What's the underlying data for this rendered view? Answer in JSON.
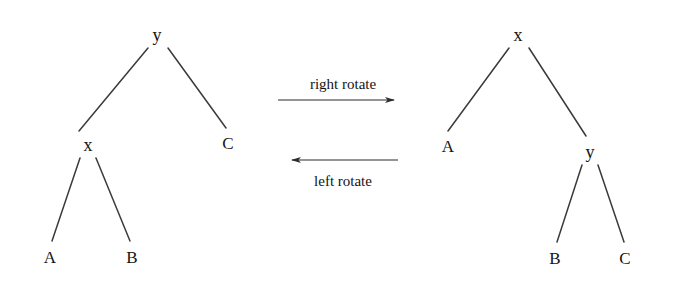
{
  "figure": {
    "background": "#ffffff",
    "stroke_color": "#3a3a3a",
    "text_color": "#151515"
  },
  "left_tree": {
    "name": "before-rotation-tree",
    "root": {
      "label": "y",
      "x": 157,
      "y": 35
    },
    "nodes": [
      {
        "id": "y",
        "label": "y",
        "x": 157,
        "y": 35
      },
      {
        "id": "x",
        "label": "x",
        "x": 88,
        "y": 145
      },
      {
        "id": "C",
        "label": "C",
        "x": 228,
        "y": 143
      },
      {
        "id": "A",
        "label": "A",
        "x": 50,
        "y": 257
      },
      {
        "id": "B",
        "label": "B",
        "x": 132,
        "y": 257
      }
    ],
    "edges": [
      {
        "from": "y",
        "to": "x",
        "x1": 148,
        "y1": 48,
        "x2": 79,
        "y2": 131
      },
      {
        "from": "y",
        "to": "C",
        "x1": 168,
        "y1": 48,
        "x2": 226,
        "y2": 128
      },
      {
        "from": "x",
        "to": "A",
        "x1": 80,
        "y1": 158,
        "x2": 52,
        "y2": 241
      },
      {
        "from": "x",
        "to": "B",
        "x1": 96,
        "y1": 158,
        "x2": 130,
        "y2": 241
      }
    ]
  },
  "right_tree": {
    "name": "after-rotation-tree",
    "root": {
      "label": "x",
      "x": 518,
      "y": 35
    },
    "nodes": [
      {
        "id": "x",
        "label": "x",
        "x": 518,
        "y": 35
      },
      {
        "id": "A",
        "label": "A",
        "x": 448,
        "y": 146
      },
      {
        "id": "y",
        "label": "y",
        "x": 590,
        "y": 152
      },
      {
        "id": "B",
        "label": "B",
        "x": 555,
        "y": 258
      },
      {
        "id": "C",
        "label": "C",
        "x": 625,
        "y": 258
      }
    ],
    "edges": [
      {
        "from": "x",
        "to": "A",
        "x1": 509,
        "y1": 48,
        "x2": 448,
        "y2": 131
      },
      {
        "from": "x",
        "to": "y",
        "x1": 529,
        "y1": 48,
        "x2": 586,
        "y2": 136
      },
      {
        "from": "y",
        "to": "B",
        "x1": 582,
        "y1": 165,
        "x2": 557,
        "y2": 242
      },
      {
        "from": "y",
        "to": "C",
        "x1": 598,
        "y1": 165,
        "x2": 624,
        "y2": 242
      }
    ]
  },
  "transforms": {
    "right_rotate": {
      "label": "right rotate",
      "direction": "right",
      "label_x": 343,
      "label_y": 84,
      "line_x1": 278,
      "line_x2": 398,
      "line_y": 100
    },
    "left_rotate": {
      "label": "left rotate",
      "direction": "left",
      "label_x": 343,
      "label_y": 181,
      "line_x1": 288,
      "line_x2": 398,
      "line_y": 160
    }
  }
}
